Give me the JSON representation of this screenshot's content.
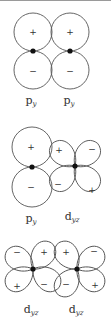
{
  "figure": {
    "panels": [
      {
        "id": "py-py",
        "labels": [
          {
            "main": "p",
            "sub": "y"
          },
          {
            "main": "p",
            "sub": "y"
          }
        ],
        "signs": [
          "+",
          "+",
          "−",
          "−"
        ]
      },
      {
        "id": "py-dyz",
        "labels": [
          {
            "main": "p",
            "sub": "y"
          },
          {
            "main": "d",
            "sub": "yz"
          }
        ],
        "signs": [
          "+",
          "−",
          "+",
          "−",
          "−",
          "+"
        ]
      },
      {
        "id": "dyz-dyz",
        "labels": [
          {
            "main": "d",
            "sub": "yz"
          },
          {
            "main": "d",
            "sub": "yz"
          }
        ],
        "signs": [
          "−",
          "+",
          "+",
          "−",
          "+",
          "−",
          "−",
          "+"
        ]
      }
    ]
  }
}
